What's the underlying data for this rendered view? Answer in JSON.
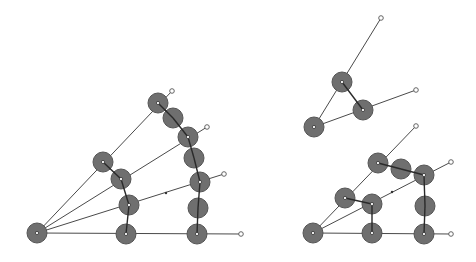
{
  "canvas": {
    "width": 476,
    "height": 262,
    "background": "#ffffff"
  },
  "colors": {
    "joint_fill": "#6f6f6f",
    "joint_stroke": "#555555",
    "ray": "#4a4a4a",
    "link": "#2a2a2a",
    "tip": "#ffffff"
  },
  "joint_radius": 10,
  "tip_radius": 2.3,
  "diagrams": [
    {
      "name": "left-fan-diagram",
      "origin": [
        37,
        233
      ],
      "rays": [
        {
          "end": [
            241,
            234
          ]
        },
        {
          "end": [
            224,
            174
          ]
        },
        {
          "end": [
            207,
            127
          ]
        },
        {
          "end": [
            172,
            91
          ]
        }
      ],
      "joints": [
        [
          37,
          233
        ],
        [
          126,
          234
        ],
        [
          197,
          234
        ],
        [
          129,
          205
        ],
        [
          198,
          208
        ],
        [
          121,
          179
        ],
        [
          200,
          182
        ],
        [
          103,
          162
        ],
        [
          194,
          158
        ],
        [
          188,
          137
        ],
        [
          173,
          118
        ],
        [
          158,
          103
        ]
      ],
      "links": [
        [
          [
            126,
            234
          ],
          [
            129,
            205
          ]
        ],
        [
          [
            129,
            205
          ],
          [
            121,
            179
          ]
        ],
        [
          [
            121,
            179
          ],
          [
            103,
            162
          ]
        ],
        [
          [
            197,
            234
          ],
          [
            198,
            208
          ]
        ],
        [
          [
            198,
            208
          ],
          [
            200,
            182
          ]
        ],
        [
          [
            200,
            182
          ],
          [
            194,
            158
          ]
        ],
        [
          [
            194,
            158
          ],
          [
            188,
            137
          ]
        ],
        [
          [
            188,
            137
          ],
          [
            173,
            118
          ]
        ],
        [
          [
            173,
            118
          ],
          [
            158,
            103
          ]
        ]
      ],
      "pivots": [
        [
          126,
          234
        ],
        [
          197,
          234
        ],
        [
          129,
          205
        ],
        [
          200,
          182
        ],
        [
          121,
          179
        ],
        [
          188,
          137
        ],
        [
          103,
          162
        ],
        [
          158,
          103
        ],
        [
          37,
          233
        ]
      ],
      "marks": [
        [
          166,
          193
        ]
      ]
    },
    {
      "name": "right-top-triangle-diagram",
      "origin": [
        314,
        127
      ],
      "rays": [
        {
          "end": [
            381,
            18
          ]
        },
        {
          "end": [
            416,
            90
          ]
        }
      ],
      "joints": [
        [
          314,
          127
        ],
        [
          342,
          82
        ],
        [
          363,
          110
        ]
      ],
      "links": [
        [
          [
            342,
            82
          ],
          [
            363,
            110
          ]
        ]
      ],
      "pivots": [
        [
          314,
          127
        ],
        [
          342,
          82
        ],
        [
          363,
          110
        ]
      ],
      "marks": []
    },
    {
      "name": "right-bottom-grid-diagram",
      "origin": [
        313,
        233
      ],
      "rays": [
        {
          "end": [
            451,
            234
          ]
        },
        {
          "end": [
            451,
            162
          ]
        },
        {
          "end": [
            416,
            126
          ]
        }
      ],
      "joints": [
        [
          313,
          233
        ],
        [
          372,
          233
        ],
        [
          424,
          234
        ],
        [
          372,
          204
        ],
        [
          425,
          206
        ],
        [
          345,
          198
        ],
        [
          424,
          175
        ],
        [
          378,
          163
        ],
        [
          401,
          169
        ]
      ],
      "links": [
        [
          [
            372,
            233
          ],
          [
            372,
            204
          ]
        ],
        [
          [
            372,
            204
          ],
          [
            345,
            198
          ]
        ],
        [
          [
            424,
            234
          ],
          [
            425,
            206
          ]
        ],
        [
          [
            425,
            206
          ],
          [
            424,
            175
          ]
        ],
        [
          [
            424,
            175
          ],
          [
            401,
            169
          ]
        ],
        [
          [
            401,
            169
          ],
          [
            378,
            163
          ]
        ]
      ],
      "pivots": [
        [
          313,
          233
        ],
        [
          372,
          233
        ],
        [
          424,
          234
        ],
        [
          372,
          204
        ],
        [
          345,
          198
        ],
        [
          424,
          175
        ],
        [
          378,
          163
        ]
      ],
      "marks": [
        [
          392,
          192
        ]
      ]
    }
  ]
}
